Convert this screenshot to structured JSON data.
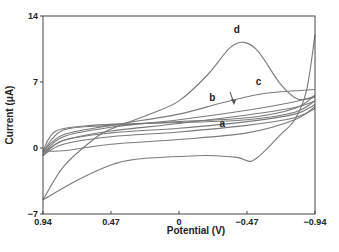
{
  "chart_data": {
    "type": "line",
    "title": "",
    "xlabel": "Potential (V)",
    "ylabel": "Current (μA)",
    "xlim": [
      0.94,
      -0.94
    ],
    "ylim": [
      -7,
      14
    ],
    "x_reversed": true,
    "grid": false,
    "xticks": [
      "0.94",
      "0.47",
      "0",
      "−0.47",
      "−0.94"
    ],
    "xtick_values": [
      0.94,
      0.47,
      0,
      -0.47,
      -0.94
    ],
    "yticks": [
      "−7",
      "0",
      "7",
      "14"
    ],
    "ytick_values": [
      -7,
      0,
      7,
      14
    ],
    "series": [
      {
        "name": "a",
        "upper": [
          [
            0.94,
            -0.8
          ],
          [
            0.8,
            0.4
          ],
          [
            0.47,
            1.2
          ],
          [
            0,
            1.7
          ],
          [
            -0.47,
            2.4
          ],
          [
            -0.8,
            3.2
          ],
          [
            -0.94,
            4.2
          ]
        ],
        "lower": [
          [
            0.94,
            -0.8
          ],
          [
            0.8,
            0.8
          ],
          [
            0.47,
            1.6
          ],
          [
            0,
            2.1
          ],
          [
            -0.47,
            2.8
          ],
          [
            -0.8,
            3.6
          ],
          [
            -0.94,
            4.6
          ]
        ]
      },
      {
        "name": "b",
        "upper": [
          [
            0.94,
            -0.6
          ],
          [
            0.8,
            0.8
          ],
          [
            0.47,
            1.8
          ],
          [
            0,
            2.6
          ],
          [
            -0.47,
            3.5
          ],
          [
            -0.8,
            4.3
          ],
          [
            -0.94,
            5.0
          ]
        ],
        "lower": [
          [
            0.94,
            -0.6
          ],
          [
            0.8,
            1.2
          ],
          [
            0.47,
            2.2
          ],
          [
            0,
            3.0
          ],
          [
            -0.47,
            4.0
          ],
          [
            -0.8,
            4.9
          ],
          [
            -0.94,
            5.5
          ]
        ]
      },
      {
        "name": "c",
        "upper": [
          [
            0.94,
            -0.4
          ],
          [
            0.8,
            1.4
          ],
          [
            0.47,
            2.4
          ],
          [
            0,
            3.6
          ],
          [
            -0.3,
            4.8
          ],
          [
            -0.6,
            5.8
          ],
          [
            -0.94,
            6.2
          ]
        ],
        "lower": [
          [
            0.94,
            -0.4
          ],
          [
            0.8,
            1.9
          ],
          [
            0.47,
            2.4
          ],
          [
            0,
            2.8
          ],
          [
            -0.47,
            3.2
          ],
          [
            -0.8,
            4.2
          ],
          [
            -0.94,
            5.6
          ]
        ]
      },
      {
        "name": "outer",
        "upper": [
          [
            0.94,
            -0.3
          ],
          [
            0.85,
            1.8
          ],
          [
            0.6,
            2.4
          ],
          [
            0.3,
            2.6
          ],
          [
            0,
            2.7
          ],
          [
            -0.47,
            3.0
          ],
          [
            -0.8,
            3.8
          ],
          [
            -0.94,
            5.0
          ]
        ],
        "lower": [
          [
            0.94,
            -0.3
          ],
          [
            0.8,
            -0.3
          ],
          [
            0.47,
            0.4
          ],
          [
            0,
            0.9
          ],
          [
            -0.47,
            1.6
          ],
          [
            -0.8,
            3.0
          ],
          [
            -0.94,
            4.4
          ]
        ]
      },
      {
        "name": "d",
        "forward": [
          [
            0.94,
            -5.5
          ],
          [
            0.8,
            -2.0
          ],
          [
            0.6,
            0.8
          ],
          [
            0.47,
            2.0
          ],
          [
            0.2,
            3.6
          ],
          [
            0,
            5.0
          ],
          [
            -0.2,
            7.8
          ],
          [
            -0.35,
            10.6
          ],
          [
            -0.45,
            11.2
          ],
          [
            -0.55,
            10.2
          ],
          [
            -0.7,
            6.8
          ],
          [
            -0.82,
            5.2
          ],
          [
            -0.94,
            5.4
          ]
        ],
        "reverse": [
          [
            -0.94,
            12.0
          ],
          [
            -0.88,
            6.0
          ],
          [
            -0.8,
            3.0
          ],
          [
            -0.7,
            1.4
          ],
          [
            -0.6,
            -0.2
          ],
          [
            -0.5,
            -1.4
          ],
          [
            -0.4,
            -1.0
          ],
          [
            -0.2,
            -0.8
          ],
          [
            0,
            -0.9
          ],
          [
            0.3,
            -1.2
          ],
          [
            0.47,
            -1.8
          ],
          [
            0.7,
            -3.4
          ],
          [
            0.94,
            -5.5
          ]
        ]
      }
    ],
    "annotations": [
      {
        "text": "d",
        "x": -0.4,
        "y": 12.2
      },
      {
        "text": "c",
        "x": -0.55,
        "y": 6.7
      },
      {
        "text": "b",
        "x": -0.23,
        "y": 5.0
      },
      {
        "text": "a",
        "x": -0.3,
        "y": 2.2
      }
    ],
    "legend": "none"
  }
}
